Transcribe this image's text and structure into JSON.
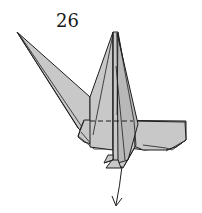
{
  "diagram": {
    "step_number": "26",
    "paper_color": "#c8c8c8",
    "line_color": "#1e1e1e",
    "background": "#ffffff",
    "symbols": [
      {
        "type": "valley-fold-line",
        "orientation": "horizontal",
        "location": "across body"
      },
      {
        "type": "arrow",
        "direction": "down",
        "location": "below body center"
      }
    ],
    "parts": [
      "tail-spike",
      "center-flaps",
      "body",
      "right-wing",
      "feet"
    ]
  }
}
